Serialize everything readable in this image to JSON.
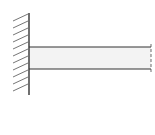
{
  "diagram": {
    "type": "cantilever-beam",
    "colors": {
      "background": "#ffffff",
      "stroke": "#333333",
      "hatch": "#555555",
      "beam_fill": "#f2f2f2"
    },
    "wall": {
      "x": 29,
      "y_top": 13,
      "y_bottom": 95,
      "hatch_count": 11
    },
    "beam": {
      "x_start": 29,
      "x_end": 151,
      "y_top": 47,
      "y_bottom": 69
    }
  }
}
